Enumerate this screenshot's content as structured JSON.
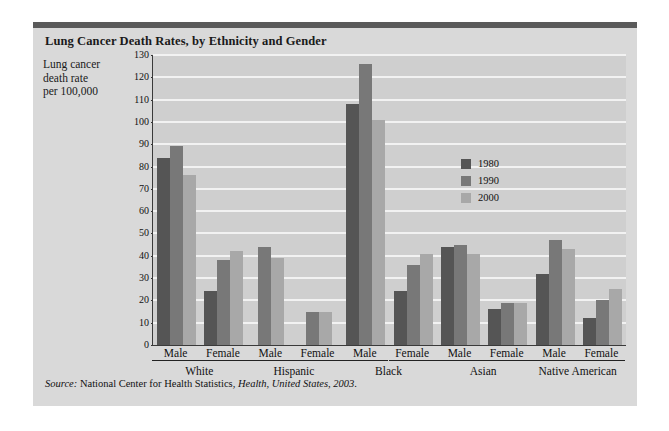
{
  "figure": {
    "title": "Lung Cancer Death Rates, by Ethnicity and Gender",
    "axis_title_lines": [
      "Lung cancer",
      "death rate",
      "per 100,000"
    ],
    "source_prefix": "Source:",
    "source_agency": "National Center for Health Statistics,",
    "source_publication": "Health, United States, 2003",
    "source_end": "."
  },
  "colors": {
    "series_1980": "#555555",
    "series_1990": "#787878",
    "series_2000": "#a8a8a8",
    "panel_background": "#d9d9d9",
    "plot_background": "#cfcfcf",
    "gridline": "#f2f2f2",
    "axis": "#3a3a3a",
    "top_rule": "#5a5a5a"
  },
  "chart_data": {
    "type": "bar",
    "title": "Lung Cancer Death Rates, by Ethnicity and Gender",
    "xlabel": "",
    "ylabel": "Lung cancer death rate per 100,000",
    "ylim": [
      0,
      130
    ],
    "ytick_step": 10,
    "yticks": [
      0,
      10,
      20,
      30,
      40,
      50,
      60,
      70,
      80,
      90,
      100,
      110,
      120,
      130
    ],
    "grid": true,
    "legend_position": "upper right inside plot",
    "ethnicities": [
      "White",
      "Hispanic",
      "Black",
      "Asian",
      "Native American"
    ],
    "genders": [
      "Male",
      "Female"
    ],
    "categories": [
      "White Male",
      "White Female",
      "Hispanic Male",
      "Hispanic Female",
      "Black Male",
      "Black Female",
      "Asian Male",
      "Asian Female",
      "Native American Male",
      "Native American Female"
    ],
    "series": [
      {
        "name": "1980",
        "color": "#555555",
        "values": [
          84,
          24,
          null,
          null,
          108,
          24,
          44,
          16,
          32,
          12
        ]
      },
      {
        "name": "1990",
        "color": "#787878",
        "values": [
          89,
          38,
          44,
          15,
          126,
          36,
          45,
          19,
          47,
          20
        ]
      },
      {
        "name": "2000",
        "color": "#a8a8a8",
        "values": [
          76,
          42,
          39,
          15,
          101,
          41,
          41,
          19,
          43,
          25
        ]
      }
    ]
  }
}
